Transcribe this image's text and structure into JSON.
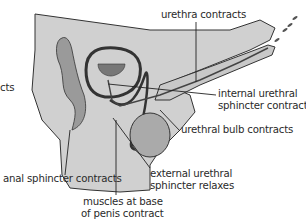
{
  "diagram": {
    "type": "anatomical cross-section",
    "colors": {
      "tissue_fill": "#d0d0d0",
      "outline": "#333333",
      "leader_line": "#222222",
      "background": "#ffffff"
    },
    "labels": {
      "left_cut": "cts",
      "urethra": "urethra contracts",
      "internal_sphincter_1": "internal urethral",
      "internal_sphincter_2": "sphincter contracts",
      "bulb": "urethral bulb contracts",
      "anal": "anal sphincter contracts",
      "external_1": "external  urethral",
      "external_2": "sphincter relaxes",
      "muscles_1": "muscles at base",
      "muscles_2": "of penis contract"
    }
  }
}
